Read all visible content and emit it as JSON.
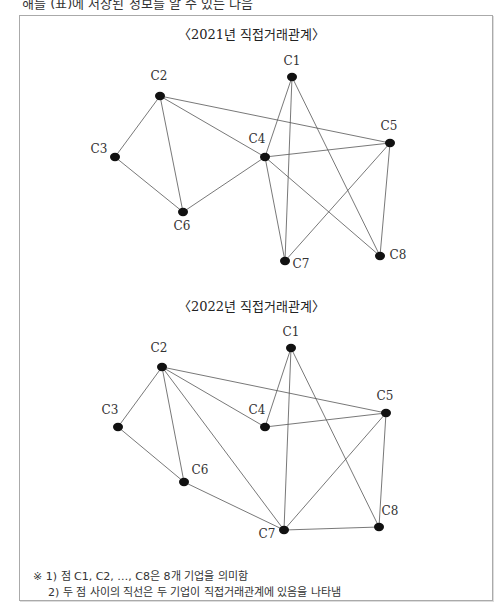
{
  "top_text": "해를 (표)에 저장된 정보를 알 수 있는 다음",
  "diagrams": [
    {
      "title": "〈2021년 직접거래관계〉",
      "nodes": {
        "C1": [
          292,
          77
        ],
        "C2": [
          160,
          96
        ],
        "C3": [
          115,
          157
        ],
        "C4": [
          265,
          157
        ],
        "C5": [
          390,
          143
        ],
        "C6": [
          183,
          212
        ],
        "C7": [
          285,
          261
        ],
        "C8": [
          380,
          256
        ]
      },
      "labels": {
        "C1": [
          292,
          65
        ],
        "C2": [
          159,
          80
        ],
        "C3": [
          99,
          153
        ],
        "C4": [
          257,
          143
        ],
        "C5": [
          389,
          130
        ],
        "C6": [
          182,
          230
        ],
        "C7": [
          301,
          268
        ],
        "C8": [
          398,
          259
        ]
      },
      "edges": [
        [
          "C2",
          "C3"
        ],
        [
          "C2",
          "C6"
        ],
        [
          "C2",
          "C4"
        ],
        [
          "C2",
          "C5"
        ],
        [
          "C3",
          "C6"
        ],
        [
          "C6",
          "C4"
        ],
        [
          "C4",
          "C1"
        ],
        [
          "C4",
          "C5"
        ],
        [
          "C4",
          "C7"
        ],
        [
          "C4",
          "C8"
        ],
        [
          "C1",
          "C7"
        ],
        [
          "C1",
          "C8"
        ],
        [
          "C5",
          "C7"
        ],
        [
          "C5",
          "C8"
        ]
      ]
    },
    {
      "title": "〈2022년 직접거래관계〉",
      "nodes": {
        "C1": [
          291,
          348
        ],
        "C2": [
          162,
          367
        ],
        "C3": [
          118,
          427
        ],
        "C4": [
          265,
          427
        ],
        "C5": [
          386,
          413
        ],
        "C6": [
          184,
          482
        ],
        "C7": [
          284,
          530
        ],
        "C8": [
          379,
          527
        ]
      },
      "labels": {
        "C1": [
          291,
          336
        ],
        "C2": [
          159,
          352
        ],
        "C3": [
          110,
          414
        ],
        "C4": [
          257,
          414
        ],
        "C5": [
          385,
          400
        ],
        "C6": [
          200,
          474
        ],
        "C7": [
          267,
          538
        ],
        "C8": [
          390,
          515
        ]
      },
      "edges": [
        [
          "C2",
          "C3"
        ],
        [
          "C2",
          "C6"
        ],
        [
          "C2",
          "C7"
        ],
        [
          "C2",
          "C4"
        ],
        [
          "C2",
          "C5"
        ],
        [
          "C3",
          "C6"
        ],
        [
          "C6",
          "C7"
        ],
        [
          "C1",
          "C4"
        ],
        [
          "C1",
          "C7"
        ],
        [
          "C1",
          "C8"
        ],
        [
          "C4",
          "C5"
        ],
        [
          "C5",
          "C7"
        ],
        [
          "C5",
          "C8"
        ],
        [
          "C7",
          "C8"
        ]
      ]
    }
  ],
  "notes": {
    "line1": "※ 1) 점 C1, C2, …, C8은 8개 기업을 의미함",
    "line2": "2) 두 점 사이의 직선은 두 기업이 직접거래관계에 있음을 나타냄"
  }
}
